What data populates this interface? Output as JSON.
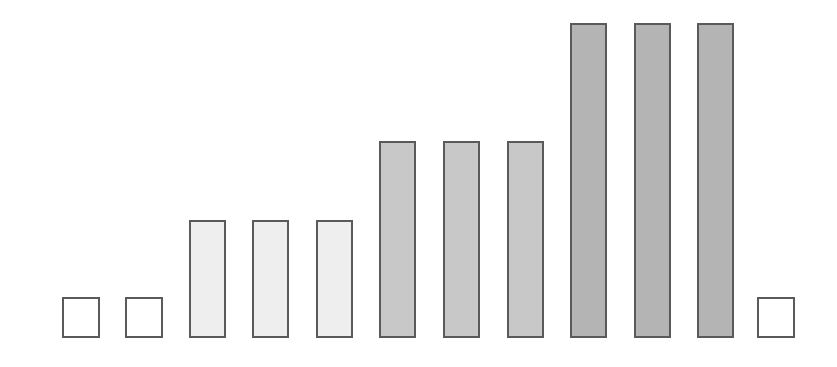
{
  "chart_data": {
    "type": "bar",
    "title": "",
    "xlabel": "",
    "ylabel": "",
    "grid": false,
    "legend": null,
    "categories": [
      "1",
      "2",
      "3",
      "4",
      "5",
      "6",
      "7",
      "8",
      "9",
      "10",
      "11",
      "12"
    ],
    "values": [
      1,
      1,
      3,
      3,
      3,
      5,
      5,
      5,
      8,
      8,
      8,
      1
    ],
    "fill_colors": [
      "#ffffff",
      "#ffffff",
      "#eeeeee",
      "#eeeeee",
      "#eeeeee",
      "#c8c8c8",
      "#c8c8c8",
      "#c8c8c8",
      "#b4b4b4",
      "#b4b4b4",
      "#b4b4b4",
      "#ffffff"
    ],
    "border_color": "#5a5a5a",
    "ylim": [
      0,
      8
    ]
  },
  "layout": {
    "baseline_y": 338,
    "unit_px": 39.4,
    "bar_width": 37,
    "bar_lefts": [
      62,
      125,
      189,
      252,
      316,
      379,
      443,
      507,
      570,
      634,
      697,
      757
    ]
  }
}
